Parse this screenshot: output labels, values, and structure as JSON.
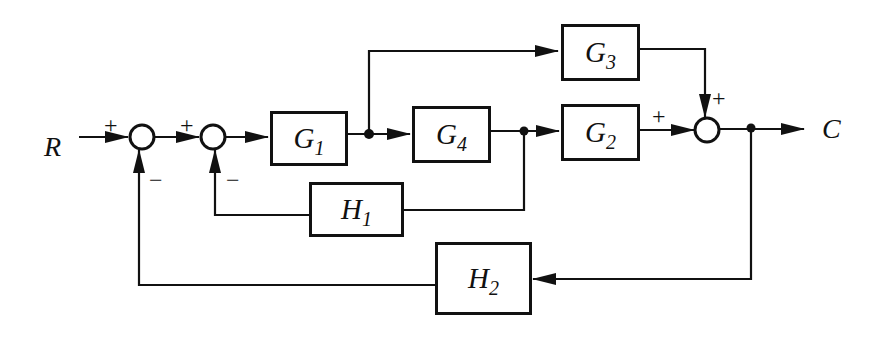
{
  "diagram": {
    "type": "control-system-block-diagram",
    "input": "R",
    "output": "C",
    "blocks": [
      {
        "id": "G1",
        "base": "G",
        "sub": "1"
      },
      {
        "id": "G4",
        "base": "G",
        "sub": "4"
      },
      {
        "id": "G2",
        "base": "G",
        "sub": "2"
      },
      {
        "id": "G3",
        "base": "G",
        "sub": "3"
      },
      {
        "id": "H1",
        "base": "H",
        "sub": "1"
      },
      {
        "id": "H2",
        "base": "H",
        "sub": "2"
      }
    ],
    "summing_junctions": [
      {
        "id": "S1",
        "signs": {
          "left": "+",
          "bottom": "−"
        }
      },
      {
        "id": "S2",
        "signs": {
          "left": "+",
          "bottom": "−"
        }
      },
      {
        "id": "S3",
        "signs": {
          "left": "+",
          "top": "+"
        }
      }
    ],
    "connections": [
      "R → S1(+)",
      "S1 → S2(+)",
      "S2 → G1",
      "G1 → G4",
      "G1 → G3",
      "G4 → G2",
      "G4 → H1 → S2(−)",
      "G2 → S3(+)",
      "G3 → S3(+)",
      "S3 → C",
      "C → H2 → S1(−)"
    ]
  }
}
